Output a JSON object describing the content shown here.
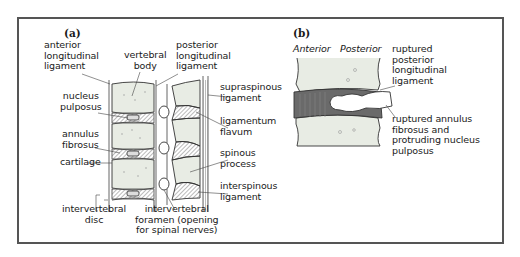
{
  "panel_a": {
    "tag": "(a)",
    "labels": {
      "anterior_longitudinal_ligament": "anterior\nlongitudinal\nligament",
      "vertebral_body": "vertebral\nbody",
      "posterior_longitudinal_ligament": "posterior\nlongitudinal\nligament",
      "nucleus_pulposus": "nucleus\npulposus",
      "annulus_fibrosus": "annulus\nfibrosus",
      "cartilage": "cartilage",
      "intervertebral_disc": "intervertebral\ndisc",
      "intervertebral_foramen": "intervertebral\nforamen (opening\nfor spinal nerves)",
      "supraspinous_ligament": "supraspinous\nligament",
      "ligamentum_flavum": "ligamentum\nflavum",
      "spinous_process": "spinous\nprocess",
      "interspinous_ligament": "interspinous\nligament"
    }
  },
  "panel_b": {
    "tag": "(b)",
    "orientation": {
      "anterior": "Anterior",
      "posterior": "Posterior"
    },
    "labels": {
      "ruptured_posterior_longitudinal_ligament": "ruptured\nposterior\nlongitudinal\nligament",
      "ruptured_annulus": "ruptured annulus\nfibrosus and\nprotruding nucleus\npulposus"
    }
  },
  "colors": {
    "border": "#555555",
    "bone_fill": "#e8ece4",
    "disc_dark": "#6a6a6a",
    "outline": "#333333"
  }
}
